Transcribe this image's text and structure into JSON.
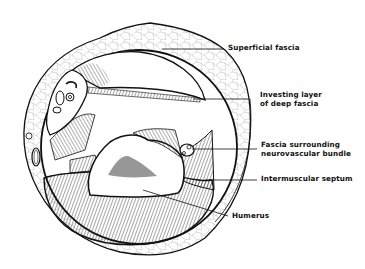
{
  "diagram": {
    "labels": {
      "superficial_fascia": "Superficial fascia",
      "investing_layer_line1": "Investing layer",
      "investing_layer_line2": "of deep fascia",
      "fascia_nv_line1": "Fascia surrounding",
      "fascia_nv_line2": "neurovascular bundle",
      "intermuscular_septum": "Intermuscular septum",
      "humerus": "Humerus"
    },
    "colors": {
      "ink": "#111111",
      "background": "#ffffff",
      "marrow": "#222222"
    }
  }
}
